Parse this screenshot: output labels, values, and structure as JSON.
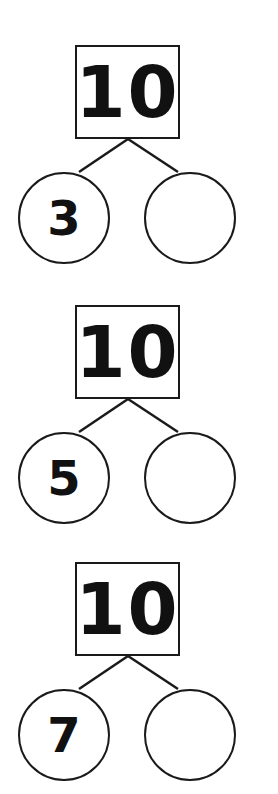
{
  "worksheet": {
    "bonds": [
      {
        "whole": "10",
        "part_left": "3",
        "part_right": ""
      },
      {
        "whole": "10",
        "part_left": "5",
        "part_right": ""
      },
      {
        "whole": "10",
        "part_left": "7",
        "part_right": ""
      }
    ]
  }
}
